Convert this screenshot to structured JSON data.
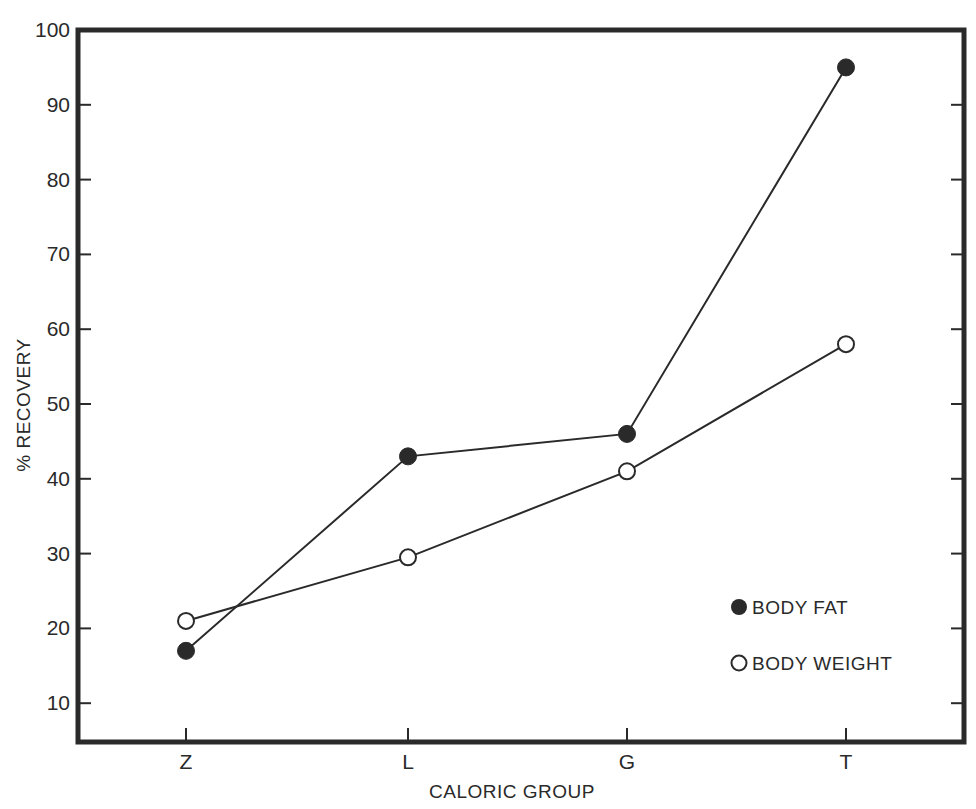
{
  "chart_data": {
    "type": "line",
    "title": "",
    "xlabel": "CALORIC GROUP",
    "ylabel": "% RECOVERY",
    "categories": [
      "Z",
      "L",
      "G",
      "T"
    ],
    "series": [
      {
        "name": "BODY FAT",
        "marker": "filled-circle",
        "values": [
          17,
          43,
          46,
          95
        ]
      },
      {
        "name": "BODY WEIGHT",
        "marker": "open-circle",
        "values": [
          21,
          29.5,
          41,
          58
        ]
      }
    ],
    "ylim": [
      5,
      100
    ],
    "yticks": [
      10,
      20,
      30,
      40,
      50,
      60,
      70,
      80,
      90,
      100
    ],
    "grid": false,
    "legend_position": "lower right (inside plot)"
  },
  "axes": {
    "y_tick_labels": [
      "10",
      "20",
      "30",
      "40",
      "50",
      "60",
      "70",
      "80",
      "90",
      "100"
    ],
    "x_tick_labels": [
      "Z",
      "L",
      "G",
      "T"
    ],
    "x_title": "CALORIC GROUP",
    "y_title": "% RECOVERY"
  },
  "legend": {
    "items": [
      {
        "label": "BODY FAT",
        "marker": "filled-circle"
      },
      {
        "label": "BODY WEIGHT",
        "marker": "open-circle"
      }
    ]
  },
  "colors": {
    "ink": "#2a2a2a",
    "background": "#ffffff"
  }
}
